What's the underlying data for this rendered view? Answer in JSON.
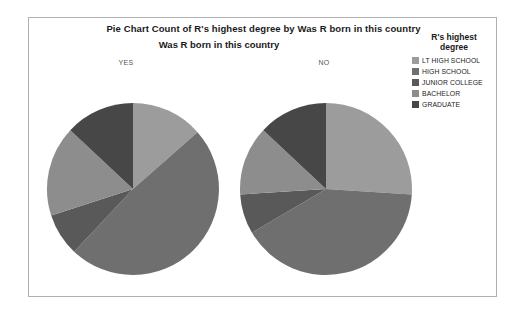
{
  "chart_title": "Pie Chart Count of R's highest degree by Was R born in this country",
  "chart_subtitle": "Was R born in this country",
  "legend": {
    "title_line1": "R's highest",
    "title_line2": "degree",
    "items": [
      {
        "label": "LT HIGH SCHOOL",
        "color": "#9c9c9c"
      },
      {
        "label": "HIGH SCHOOL",
        "color": "#6f6f6f"
      },
      {
        "label": "JUNIOR COLLEGE",
        "color": "#595959"
      },
      {
        "label": "BACHELOR",
        "color": "#8d8d8d"
      },
      {
        "label": "GRADUATE",
        "color": "#474747"
      }
    ]
  },
  "panels": [
    {
      "label": "YES"
    },
    {
      "label": "NO"
    }
  ],
  "chart_data": {
    "type": "pie",
    "title": "Pie Chart Count of R's highest degree by Was R born in this country",
    "subtitle": "Was R born in this country",
    "grid": false,
    "legend_position": "right",
    "legend_title": "R's highest degree",
    "categories": [
      "LT HIGH SCHOOL",
      "HIGH SCHOOL",
      "JUNIOR COLLEGE",
      "BACHELOR",
      "GRADUATE"
    ],
    "colors": [
      "#9c9c9c",
      "#6f6f6f",
      "#595959",
      "#8d8d8d",
      "#474747"
    ],
    "start_angle": 0,
    "direction": "clockwise",
    "panel_variable": "Was R born in this country",
    "series": [
      {
        "name": "YES",
        "values": [
          13.5,
          48.5,
          8.0,
          17.0,
          13.0
        ]
      },
      {
        "name": "NO",
        "values": [
          26.0,
          40.5,
          7.5,
          13.0,
          13.0
        ]
      }
    ]
  }
}
